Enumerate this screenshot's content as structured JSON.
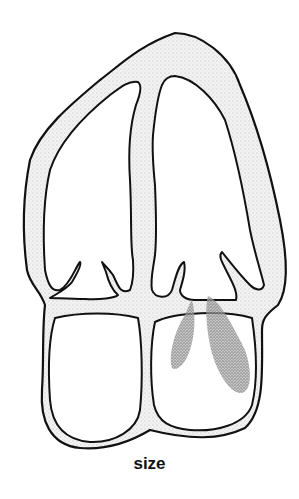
{
  "figure": {
    "caption": "size",
    "colors": {
      "outline": "#111111",
      "wall_fill": "#e6e6e6",
      "shading": "#7a7a7a",
      "background": "#ffffff"
    }
  }
}
